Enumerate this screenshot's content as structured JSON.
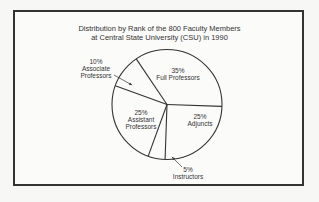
{
  "chart_data": {
    "type": "pie",
    "title_lines": [
      "Distribution by Rank of the 800 Faculty Members",
      "at Central State University (CSU) in 1990"
    ],
    "categories": [
      "Full Professors",
      "Adjuncts",
      "Instructors",
      "Assistant Professors",
      "Associate Professors"
    ],
    "values": [
      35,
      25,
      5,
      25,
      10
    ],
    "unit": "%",
    "total_count": 800,
    "labels": [
      {
        "pct": "35%",
        "name": "Full Professors"
      },
      {
        "pct": "25%",
        "name": "Adjuncts"
      },
      {
        "pct": "5%",
        "name": "Instructors"
      },
      {
        "pct": "25%",
        "name": "Assistant Professors",
        "name_l1": "Assistant",
        "name_l2": "Professors"
      },
      {
        "pct": "10%",
        "name": "Associate Professors",
        "name_l1": "Associate",
        "name_l2": "Professors"
      }
    ],
    "legend": "none (direct labels)",
    "colors": {
      "fill": "#fbfbfa",
      "stroke": "#333333"
    }
  }
}
